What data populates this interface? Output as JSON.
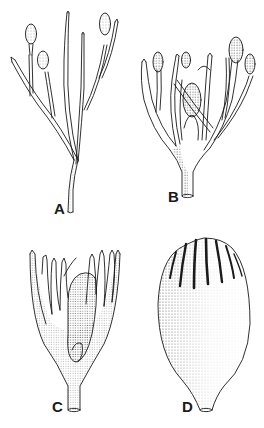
{
  "figure": {
    "top_fragment": "",
    "panels": [
      {
        "id": "A",
        "label": "A",
        "description": "Slender branched stalk with three ovoid terminal bodies"
      },
      {
        "id": "B",
        "label": "B",
        "description": "Densely branched cluster with several ovoid bodies and a central enlarged body"
      },
      {
        "id": "C",
        "label": "C",
        "description": "Cup-shaped base with finger-like lobes enclosing a stippled inner mass"
      },
      {
        "id": "D",
        "label": "D",
        "description": "Ovoid stippled capsule with ribbed, furrowed apex"
      }
    ],
    "colors": {
      "ink": "#1a1a1a",
      "background": "#ffffff",
      "stipple": "#555555"
    }
  }
}
